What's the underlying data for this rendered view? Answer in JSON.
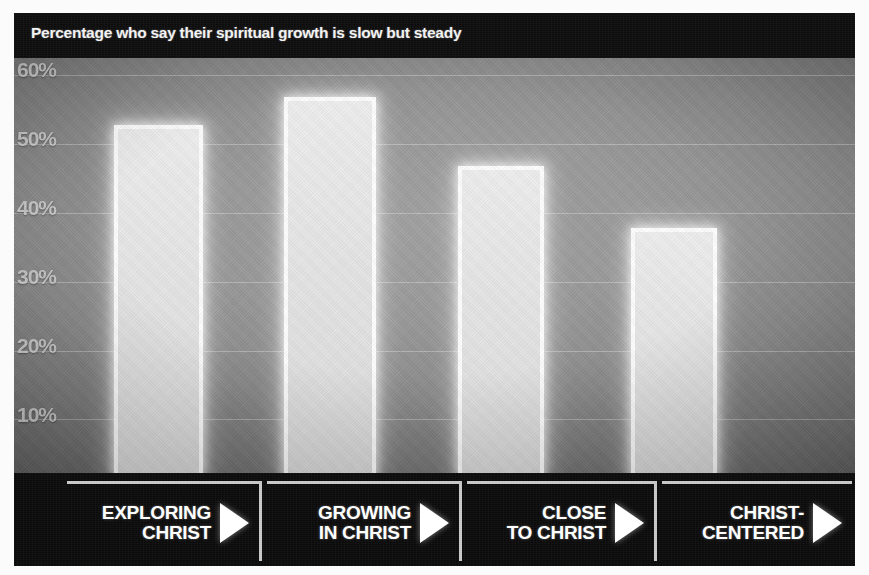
{
  "chart_data": {
    "type": "bar",
    "title": "Percentage who say their spiritual growth is slow but steady",
    "categories": [
      "EXPLORING\nCHRIST",
      "GROWING\nIN CHRIST",
      "CLOSE\nTO CHRIST",
      "CHRIST-\nCENTERED"
    ],
    "values": [
      50,
      54,
      44,
      35
    ],
    "xlabel": "",
    "ylabel": "",
    "ylim": [
      0,
      62
    ],
    "ytick_labels": [
      "60%",
      "50%",
      "40%",
      "30%",
      "20%",
      "10%"
    ],
    "ytick_values": [
      60,
      50,
      40,
      30,
      20,
      10
    ],
    "grid": true,
    "legend": "none",
    "bar_color": "#ffffff",
    "background_color": "#8a8a8a",
    "title_band_color": "#0d0d0d",
    "label_band_color": "#0b0b0b",
    "frame_color": "#fbfbfb",
    "gridline_color": "#ffffff"
  },
  "axis": {
    "ticks": [
      {
        "label": "60%",
        "value": 60
      },
      {
        "label": "50%",
        "value": 50
      },
      {
        "label": "40%",
        "value": 40
      },
      {
        "label": "30%",
        "value": 30
      },
      {
        "label": "20%",
        "value": 20
      },
      {
        "label": "10%",
        "value": 10
      }
    ]
  },
  "categories": [
    {
      "id": "exploring-christ",
      "line1": "EXPLORING",
      "line2": "CHRIST",
      "icon": "play-triangle-icon",
      "value": 50
    },
    {
      "id": "growing-in-christ",
      "line1": "GROWING",
      "line2": "IN CHRIST",
      "icon": "play-triangle-icon",
      "value": 54
    },
    {
      "id": "close-to-christ",
      "line1": "CLOSE",
      "line2": "TO CHRIST",
      "icon": "play-triangle-icon",
      "value": 44
    },
    {
      "id": "christ-centered",
      "line1": "CHRIST-",
      "line2": "CENTERED",
      "icon": "play-triangle-icon",
      "value": 35
    }
  ]
}
